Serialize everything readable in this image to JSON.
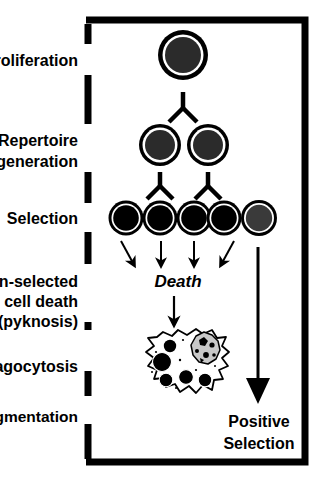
{
  "figure": {
    "type": "biological-process-diagram",
    "colors": {
      "background": "#ffffff",
      "ink": "#000000",
      "surviving_cell_fill": "#3a3a3a",
      "dying_cell_fill": "#000000",
      "apoptotic_body_fill": "#c8c8c8"
    }
  },
  "stage_labels": [
    {
      "id": "proliferation",
      "text": "Proliferation",
      "lines": [
        "Proliferation"
      ]
    },
    {
      "id": "repertoire-generation",
      "text": "Repertoire generation",
      "lines": [
        "Repertoire",
        "generation"
      ]
    },
    {
      "id": "selection",
      "text": "Selection",
      "lines": [
        "Selection"
      ]
    },
    {
      "id": "non-selected-cell-death",
      "text": "Non-selected cell death (pyknosis)",
      "lines": [
        "Non-selected",
        "cell death",
        "(pyknosis)"
      ]
    },
    {
      "id": "phagocytosis",
      "text": "Phagocytosis",
      "lines": [
        "Phagocytosis"
      ]
    },
    {
      "id": "dna-fragmentation",
      "text": "DNA fragmentation",
      "lines": [
        "DNA fragmentation"
      ]
    }
  ],
  "annotations": {
    "death_label": "Death",
    "positive_selection": {
      "lines": [
        "Positive",
        "Selection"
      ]
    }
  },
  "cell_rows": {
    "proliferation": {
      "count": 1,
      "fates": [
        "dividing"
      ]
    },
    "repertoire": {
      "count": 2,
      "fates": [
        "dividing",
        "dividing"
      ]
    },
    "selection": {
      "count": 5,
      "fates": [
        "dying",
        "dying",
        "dying",
        "dying",
        "surviving"
      ]
    }
  },
  "flow": {
    "death_arrow_count": 4,
    "positive_selection_arrow": 1,
    "branch_connectors": 3
  }
}
